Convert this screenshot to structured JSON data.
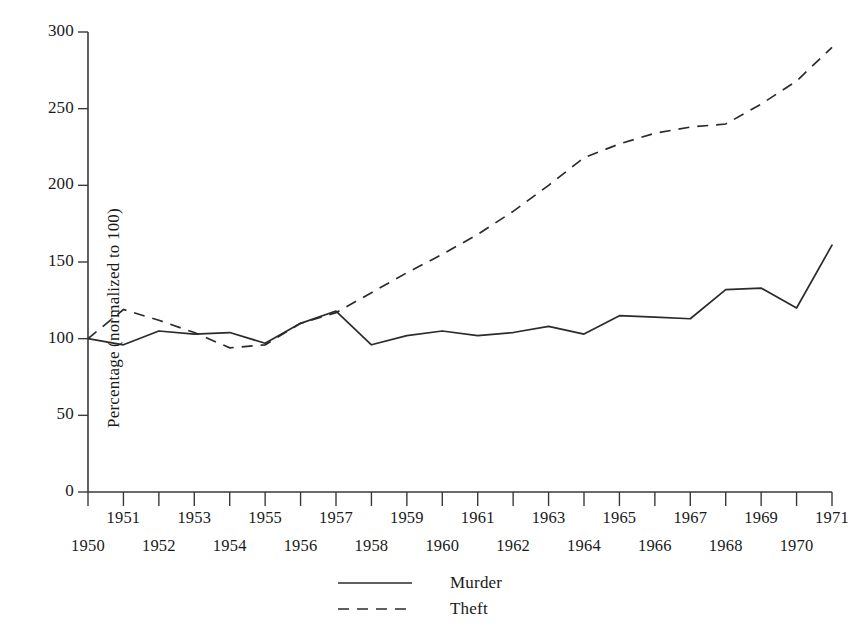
{
  "chart_data": {
    "type": "line",
    "title": "",
    "xlabel": "",
    "ylabel": "Percentage (normalized to 100)",
    "x": [
      1950,
      1951,
      1952,
      1953,
      1954,
      1955,
      1956,
      1957,
      1958,
      1959,
      1960,
      1961,
      1962,
      1963,
      1964,
      1965,
      1966,
      1967,
      1968,
      1969,
      1970,
      1971
    ],
    "xlim": [
      1950,
      1971
    ],
    "ylim": [
      0,
      300
    ],
    "yticks": [
      0,
      50,
      100,
      150,
      200,
      250,
      300
    ],
    "ytick_labels": [
      "0",
      "50",
      "100",
      "150",
      "200",
      "250",
      "300"
    ],
    "xtick_labels": [
      "1950",
      "1951",
      "1952",
      "1953",
      "1954",
      "1955",
      "1956",
      "1957",
      "1958",
      "1959",
      "1960",
      "1961",
      "1962",
      "1963",
      "1964",
      "1965",
      "1966",
      "1967",
      "1968",
      "1969",
      "1970",
      "1971"
    ],
    "xtick_label_rows": "staggered: even years lower row, odd years upper row",
    "grid": false,
    "legend_position": "bottom-center",
    "series": [
      {
        "name": "Murder",
        "style": "solid",
        "color": "#2b2b2b",
        "values": [
          100,
          96,
          105,
          103,
          104,
          97,
          110,
          118,
          96,
          102,
          105,
          102,
          104,
          108,
          103,
          115,
          114,
          113,
          132,
          133,
          120,
          161
        ]
      },
      {
        "name": "Theft",
        "style": "dashed",
        "color": "#2b2b2b",
        "values": [
          100,
          119,
          112,
          104,
          94,
          96,
          110,
          117,
          130,
          143,
          155,
          168,
          183,
          200,
          218,
          227,
          234,
          238,
          240,
          253,
          268,
          290
        ]
      }
    ]
  },
  "legend": {
    "items": [
      {
        "label": "Murder",
        "style": "solid"
      },
      {
        "label": "Theft",
        "style": "dashed"
      }
    ]
  }
}
